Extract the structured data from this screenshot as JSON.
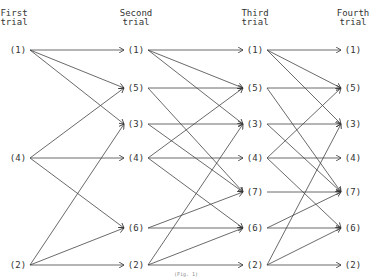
{
  "columns": [
    {
      "label_line1": "First",
      "label_line2": "trial",
      "nodes": [
        "1",
        "4",
        "2"
      ]
    },
    {
      "label_line1": "Second",
      "label_line2": "trial",
      "nodes": [
        "1",
        "5",
        "3",
        "4",
        "6",
        "2"
      ]
    },
    {
      "label_line1": "Third",
      "label_line2": "trial",
      "nodes": [
        "1",
        "5",
        "3",
        "4",
        "7",
        "6",
        "2"
      ]
    },
    {
      "label_line1": "Fourth",
      "label_line2": "trial",
      "nodes": [
        "1",
        "5",
        "3",
        "4",
        "7",
        "6",
        "2"
      ]
    }
  ],
  "node_rows": [
    "1",
    "5",
    "3",
    "4",
    "7",
    "6",
    "2"
  ],
  "transitions": {
    "1": [
      "1",
      "5",
      "3"
    ],
    "4": [
      "5",
      "4",
      "6"
    ],
    "2": [
      "3",
      "6",
      "2"
    ],
    "5": [
      "5",
      "7"
    ],
    "3": [
      "3",
      "7"
    ],
    "6": [
      "7",
      "6"
    ],
    "7": [
      "7"
    ]
  },
  "caption": "(Fig. 1)"
}
